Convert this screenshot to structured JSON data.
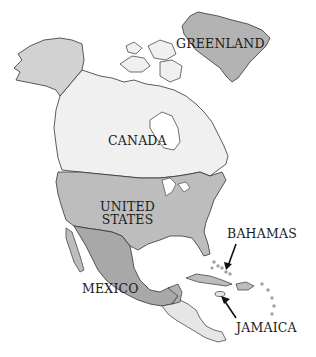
{
  "map": {
    "title": "North America",
    "colors": {
      "background": "#ffffff",
      "greenland": "#b3b3b3",
      "canada": "#f0f0f0",
      "alaska": "#d2d2d2",
      "united_states": "#bdbdbd",
      "mexico": "#a8a8a8",
      "central_america_light": "#e6e6e6",
      "central_america_dark": "#b0b0b0",
      "caribbean": "#bdbdbd",
      "outline": "#333333"
    },
    "labels": {
      "greenland": "GREENLAND",
      "canada": "CANADA",
      "united_states_line1": "UNITED",
      "united_states_line2": "STATES",
      "mexico": "MEXICO",
      "bahamas": "BAHAMAS",
      "jamaica": "JAMAICA"
    },
    "arrows": [
      {
        "name": "bahamas-arrow",
        "target": "Bahamas"
      },
      {
        "name": "jamaica-arrow",
        "target": "Jamaica"
      }
    ]
  }
}
